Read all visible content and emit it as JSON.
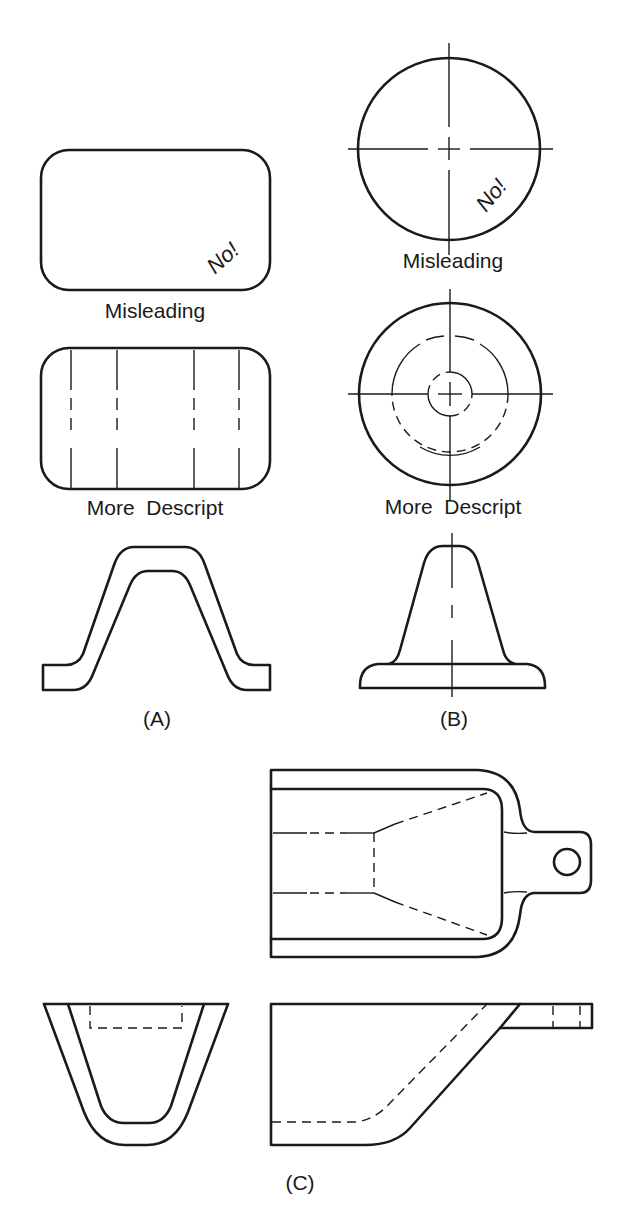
{
  "figure": {
    "panel_a": {
      "label": "(A)",
      "misleading_caption": "Misleading",
      "misleading_note": "No!",
      "descriptive_caption": "More  Descript"
    },
    "panel_b": {
      "label": "(B)",
      "misleading_caption": "Misleading",
      "misleading_note": "No!",
      "descriptive_caption": "More  Descript"
    },
    "panel_c": {
      "label": "(C)"
    }
  },
  "colors": {
    "line": "#1a1a1a",
    "background": "#ffffff"
  }
}
